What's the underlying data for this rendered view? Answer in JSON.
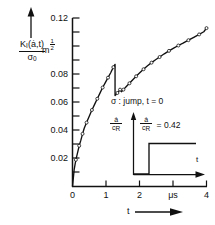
{
  "figure": {
    "background": "#ffffff",
    "ink": "#111111"
  },
  "axes": {
    "y": {
      "label_numerator": "K",
      "label_numerator_sub": "I",
      "label_numerator_args": "(ȧ,t)",
      "label_denominator": "σ",
      "label_denominator_sub": "0",
      "unit": "m",
      "unit_exponent_num": "1",
      "unit_exponent_den": "2",
      "arrow": "up-arrow-icon",
      "min": 0,
      "max": 0.12,
      "tick_step": 0.01,
      "labeled_ticks": [
        "0.12",
        "0.08",
        "0.06",
        "0.04",
        "0.02"
      ],
      "labeled_tick_values": [
        0.12,
        0.08,
        0.06,
        0.04,
        0.02
      ]
    },
    "x": {
      "label": "t",
      "arrow": "right-arrow-icon",
      "min": 0,
      "max": 4,
      "tick_step": 1,
      "tick_labels": [
        "0",
        "1",
        "2",
        "μs",
        "4"
      ],
      "tick_values": [
        0,
        1,
        2,
        3,
        4
      ],
      "unit": "μs",
      "unit_at_tick": 3
    }
  },
  "annotation": {
    "text": "σ : jump, t = 0"
  },
  "inset": {
    "y_label_num": "ȧ",
    "y_label_den": "c",
    "y_label_den_sub": "R",
    "value_label_num": "ȧ",
    "value_label_den": "c",
    "value_label_den_sub": "R",
    "value_text": "= 0.42",
    "value": 0.42,
    "x_label": "t",
    "step_time": 0,
    "step_level": 0.42
  },
  "chart_data": {
    "type": "line",
    "title": "",
    "xlabel": "t",
    "ylabel": "K_I(ȧ,t)/σ_0",
    "xunit": "μs",
    "yunit": "m^(1/2)",
    "xlim": [
      0,
      4
    ],
    "ylim": [
      0,
      0.12
    ],
    "grid": false,
    "legend": null,
    "series": [
      {
        "name": "K_I(ȧ,t)/σ_0 (numerical, with jump at t≈1.27)",
        "style": "solid-line-with-markers",
        "marker": "open-circle",
        "x": [
          0.0,
          0.05,
          0.1,
          0.15,
          0.2,
          0.25,
          0.3,
          0.35,
          0.42,
          0.5,
          0.58,
          0.66,
          0.74,
          0.82,
          0.9,
          0.98,
          1.06,
          1.14,
          1.22,
          1.27,
          1.27,
          1.3,
          1.34,
          1.38,
          1.42,
          1.46,
          1.52,
          1.6,
          1.7,
          1.8,
          1.9,
          2.0,
          2.12,
          2.24,
          2.36,
          2.48,
          2.6,
          2.74,
          2.88,
          3.02,
          3.16,
          3.3,
          3.46,
          3.62,
          3.78,
          3.92,
          4.0
        ],
        "y": [
          0.0,
          0.012,
          0.019,
          0.024,
          0.029,
          0.033,
          0.0375,
          0.0415,
          0.0455,
          0.05,
          0.0545,
          0.0585,
          0.0625,
          0.0665,
          0.0705,
          0.074,
          0.0775,
          0.081,
          0.085,
          0.087,
          0.0648,
          0.0655,
          0.0666,
          0.0678,
          0.069,
          0.0675,
          0.069,
          0.071,
          0.0735,
          0.076,
          0.0785,
          0.0808,
          0.0835,
          0.086,
          0.0882,
          0.0903,
          0.0922,
          0.0945,
          0.0966,
          0.0986,
          0.1004,
          0.1021,
          0.1042,
          0.1062,
          0.1083,
          0.1102,
          0.1128
        ]
      }
    ],
    "features": {
      "jump_time": 1.27,
      "peak_before_jump": 0.087,
      "value_after_jump": 0.0648,
      "final_value": 0.113
    }
  }
}
